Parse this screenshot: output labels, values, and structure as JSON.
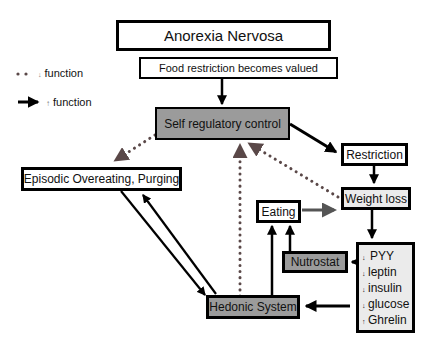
{
  "legend": {
    "items": [
      {
        "symbol": "dotted-arrow",
        "arrow": "↓",
        "label": "function"
      },
      {
        "symbol": "solid-arrow",
        "arrow": "↑",
        "label": "function"
      }
    ]
  },
  "nodes": {
    "anorexia": "Anorexia Nervosa",
    "food_restriction": "Food restriction becomes valued",
    "self_regulatory": "Self regulatory control",
    "restriction": "Restriction",
    "episodic": "Episodic Overeating, Purging",
    "weight_loss": "Weight loss",
    "eating": "Eating",
    "nutrostat": "Nutrostat",
    "hedonic": "Hedonic System"
  },
  "hormones": [
    {
      "arrow": "↓",
      "name": "PYY"
    },
    {
      "arrow": "↓",
      "name": "leptin"
    },
    {
      "arrow": "↓",
      "name": "insulin"
    },
    {
      "arrow": "↓",
      "name": "glucose"
    },
    {
      "arrow": "↑",
      "name": "Ghrelin"
    }
  ],
  "colors": {
    "dark_fill": "#9b9b9b",
    "light_fill": "#ebebeb",
    "dotted_line": "#5a4848",
    "solid_line": "#000000",
    "gray_arrow": "#666666"
  },
  "edges": [
    {
      "from": "food_restriction",
      "to": "self_regulatory",
      "style": "solid"
    },
    {
      "from": "self_regulatory",
      "to": "restriction",
      "style": "solid"
    },
    {
      "from": "self_regulatory",
      "to": "episodic",
      "style": "dotted"
    },
    {
      "from": "restriction",
      "to": "weight_loss",
      "style": "solid"
    },
    {
      "from": "weight_loss",
      "to": "self_regulatory",
      "style": "dotted"
    },
    {
      "from": "self_regulatory",
      "to": "weight_loss",
      "style": "dotted"
    },
    {
      "from": "hedonic",
      "to": "self_regulatory",
      "style": "dotted"
    },
    {
      "from": "eating",
      "to": "weight_loss",
      "style": "solid-gray"
    },
    {
      "from": "weight_loss",
      "to": "hormones",
      "style": "solid"
    },
    {
      "from": "hormones",
      "to": "nutrostat",
      "style": "solid"
    },
    {
      "from": "hormones",
      "to": "hedonic",
      "style": "solid"
    },
    {
      "from": "nutrostat",
      "to": "eating",
      "style": "solid"
    },
    {
      "from": "hedonic",
      "to": "eating",
      "style": "solid"
    },
    {
      "from": "episodic",
      "to": "hedonic",
      "style": "solid"
    },
    {
      "from": "hedonic",
      "to": "episodic",
      "style": "solid"
    }
  ]
}
